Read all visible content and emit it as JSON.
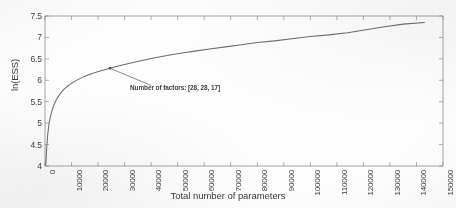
{
  "chart_data": {
    "type": "line",
    "title": "",
    "xlabel": "Total number of parameters",
    "ylabel": "ln(ESS)",
    "xlim": [
      0,
      150000
    ],
    "ylim": [
      4,
      7.5
    ],
    "grid": false,
    "legend": null,
    "xticks": [
      0,
      10000,
      20000,
      30000,
      40000,
      50000,
      60000,
      70000,
      80000,
      90000,
      100000,
      110000,
      120000,
      130000,
      140000,
      150000
    ],
    "xticklabels": [
      "0",
      "10000",
      "20000",
      "30000",
      "40000",
      "50000",
      "60000",
      "70000",
      "80000",
      "90000",
      "100000",
      "110000",
      "120000",
      "130000",
      "140000",
      "150000"
    ],
    "yticks": [
      4,
      4.5,
      5,
      5.5,
      6,
      6.5,
      7,
      7.5
    ],
    "yticklabels": [
      "4",
      "4.5",
      "5",
      "5.5",
      "6",
      "6.5",
      "7",
      "7.5"
    ],
    "series": [
      {
        "name": "ln(ESS)",
        "color": "#6d6d6d",
        "x": [
          300,
          600,
          1000,
          1600,
          2300,
          3200,
          4200,
          5400,
          6800,
          8400,
          10200,
          12200,
          14500,
          17000,
          19800,
          22800,
          24500,
          28000,
          32000,
          36500,
          41000,
          46000,
          51000,
          56500,
          62000,
          68000,
          74000,
          80000,
          86500,
          93000,
          100000,
          107000,
          114000,
          121000,
          128000,
          135000,
          143000
        ],
        "y": [
          4.02,
          4.38,
          4.72,
          5.02,
          5.22,
          5.4,
          5.54,
          5.66,
          5.77,
          5.86,
          5.94,
          6.01,
          6.08,
          6.14,
          6.2,
          6.25,
          6.28,
          6.34,
          6.4,
          6.46,
          6.52,
          6.58,
          6.63,
          6.68,
          6.73,
          6.78,
          6.83,
          6.88,
          6.92,
          6.97,
          7.02,
          7.06,
          7.11,
          7.18,
          7.25,
          7.31,
          7.35
        ]
      }
    ],
    "annotations": [
      {
        "text": "Number of factors: [28, 28, 17]",
        "point_x": 24500,
        "point_y": 6.28,
        "text_x": 40000,
        "text_y": 5.88
      }
    ]
  },
  "axes": {
    "ylabel": "ln(ESS)",
    "xlabel": "Total number of parameters"
  },
  "annotation_text": "Number of factors: [28, 28, 17]"
}
